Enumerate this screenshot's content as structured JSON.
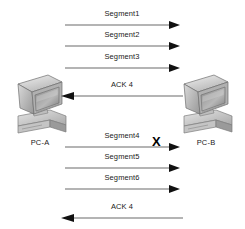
{
  "diagram": {
    "type": "sequence-diagram",
    "line_color": "#6b6b6b",
    "text_color": "#1a1a1a",
    "background": "#ffffff",
    "hosts": [
      {
        "id": "pc-a",
        "label": "PC-A",
        "side": "left",
        "icon": "desktop-computer-icon"
      },
      {
        "id": "pc-b",
        "label": "PC-B",
        "side": "right",
        "icon": "desktop-computer-icon"
      }
    ],
    "messages": [
      {
        "label": "Segment1",
        "direction": "right",
        "lost": false
      },
      {
        "label": "Segment2",
        "direction": "right",
        "lost": false
      },
      {
        "label": "Segment3",
        "direction": "right",
        "lost": false
      },
      {
        "label": "ACK 4",
        "direction": "left",
        "lost": false
      },
      {
        "label": "Segment4",
        "direction": "right",
        "lost": true
      },
      {
        "label": "Segment5",
        "direction": "right",
        "lost": false
      },
      {
        "label": "Segment6",
        "direction": "right",
        "lost": false
      },
      {
        "label": "ACK 4",
        "direction": "left",
        "lost": false
      }
    ],
    "loss_marker": "X"
  }
}
